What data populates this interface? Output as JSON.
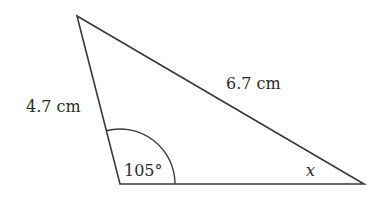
{
  "diagram": {
    "type": "triangle",
    "vertices": {
      "top": [
        77,
        16
      ],
      "bottom_left": [
        120,
        184
      ],
      "bottom_right": [
        364,
        184
      ]
    },
    "sides": {
      "left": "4.7 cm",
      "top_hypotenuse": "6.7 cm"
    },
    "angles": {
      "bottom_left": "105°",
      "bottom_right": "x"
    },
    "colors": {
      "stroke": "#3a3a3a",
      "text": "#2b2b2b",
      "background": "#ffffff"
    }
  }
}
